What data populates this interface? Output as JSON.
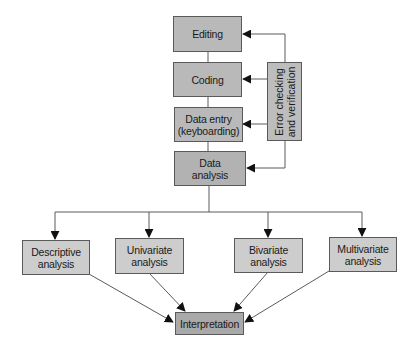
{
  "diagram": {
    "type": "flowchart",
    "colors": {
      "box_top": "#b9b9b9",
      "box_analysis": "#b2b2b2",
      "box_methods": "#cdcdcd",
      "box_interpretation": "#a9a9a9",
      "line": "#5a5a5a",
      "arrowhead": "#111111"
    },
    "pipeline": [
      {
        "id": "editing",
        "label": "Editing"
      },
      {
        "id": "coding",
        "label": "Coding"
      },
      {
        "id": "data_entry",
        "label": "Data entry\n(keyboarding)"
      },
      {
        "id": "data_analysis",
        "label": "Data\nanalysis"
      }
    ],
    "side_box": {
      "id": "error_checking",
      "label": "Error checking\nand verification",
      "feeds": [
        "editing",
        "coding",
        "data_entry",
        "data_analysis"
      ]
    },
    "methods": [
      {
        "id": "descriptive",
        "label": "Descriptive\nanalysis"
      },
      {
        "id": "univariate",
        "label": "Univariate\nanalysis"
      },
      {
        "id": "bivariate",
        "label": "Bivariate\nanalysis"
      },
      {
        "id": "multivariate",
        "label": "Multivariate\nanalysis"
      }
    ],
    "final": {
      "id": "interpretation",
      "label": "Interpretation"
    },
    "edges": [
      [
        "editing",
        "coding"
      ],
      [
        "coding",
        "data_entry"
      ],
      [
        "data_entry",
        "data_analysis"
      ],
      [
        "error_checking",
        "editing"
      ],
      [
        "error_checking",
        "coding"
      ],
      [
        "error_checking",
        "data_entry"
      ],
      [
        "error_checking",
        "data_analysis"
      ],
      [
        "data_analysis",
        "descriptive"
      ],
      [
        "data_analysis",
        "univariate"
      ],
      [
        "data_analysis",
        "bivariate"
      ],
      [
        "data_analysis",
        "multivariate"
      ],
      [
        "descriptive",
        "interpretation"
      ],
      [
        "univariate",
        "interpretation"
      ],
      [
        "bivariate",
        "interpretation"
      ],
      [
        "multivariate",
        "interpretation"
      ]
    ]
  }
}
